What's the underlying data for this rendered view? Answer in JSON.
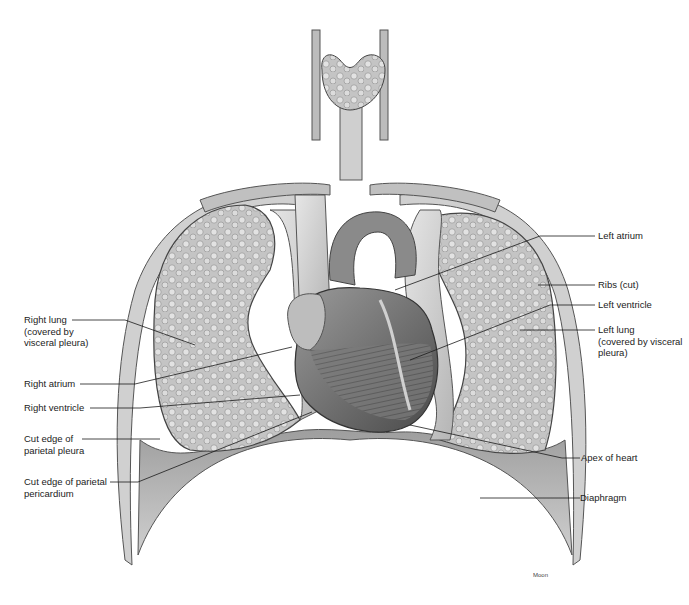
{
  "figure": {
    "credit": "Moon",
    "colors": {
      "background": "#ffffff",
      "tissue_light": "#d9d9d9",
      "tissue_mid": "#a8a8a8",
      "tissue_dark": "#5e5e5e",
      "line": "#1a1a1a"
    }
  },
  "labels_left": [
    {
      "id": "right-lung",
      "text": "Right lung\n(covered by\nvisceral pleura)"
    },
    {
      "id": "right-atrium",
      "text": "Right atrium"
    },
    {
      "id": "right-ventricle",
      "text": "Right ventricle"
    },
    {
      "id": "cut-edge-parietal-pleura",
      "text": "Cut edge of\nparietal pleura"
    },
    {
      "id": "cut-edge-parietal-pericardium",
      "text": "Cut edge of parietal\npericardium"
    }
  ],
  "labels_right": [
    {
      "id": "left-atrium",
      "text": "Left atrium"
    },
    {
      "id": "ribs-cut",
      "text": "Ribs (cut)"
    },
    {
      "id": "left-ventricle",
      "text": "Left ventricle"
    },
    {
      "id": "left-lung",
      "text": "Left lung\n(covered by visceral\npleura)"
    },
    {
      "id": "apex-of-heart",
      "text": "Apex of heart"
    },
    {
      "id": "diaphragm",
      "text": "Diaphragm"
    }
  ]
}
